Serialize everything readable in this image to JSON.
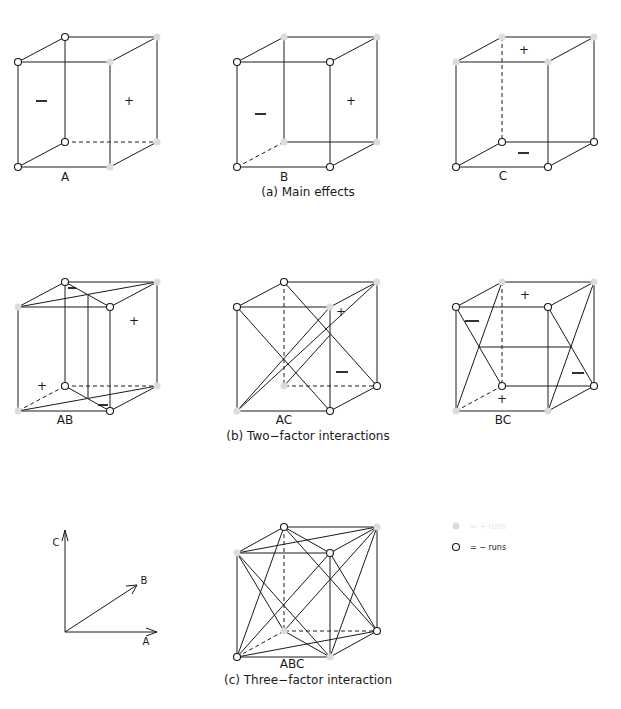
{
  "figure": {
    "captions": {
      "main_effects": "(a) Main effects",
      "two_factor": "(b) Two−factor interactions",
      "three_factor": "(c) Three−factor interaction"
    },
    "cubes": [
      {
        "id": "A",
        "label": "A",
        "plus": "+",
        "minus": "−"
      },
      {
        "id": "B",
        "label": "B",
        "plus": "+",
        "minus": "−"
      },
      {
        "id": "C",
        "label": "C",
        "plus": "+",
        "minus": "−"
      },
      {
        "id": "AB",
        "label": "AB",
        "plus": "+",
        "minus": "−"
      },
      {
        "id": "AC",
        "label": "AC",
        "plus": "+",
        "minus": "−"
      },
      {
        "id": "BC",
        "label": "BC",
        "plus": "+",
        "minus": "−"
      },
      {
        "id": "ABC",
        "label": "ABC"
      }
    ],
    "axes": {
      "x": "A",
      "y": "C",
      "z": "B"
    },
    "legend": {
      "plus_runs": "= + runs",
      "minus_runs": "= − runs",
      "plus_marker": "gray-dot",
      "minus_marker": "open-circle"
    },
    "colors": {
      "line": "#1a1a1a",
      "plus_run": "#dcdcdc",
      "minus_run": "#ffffff"
    }
  }
}
